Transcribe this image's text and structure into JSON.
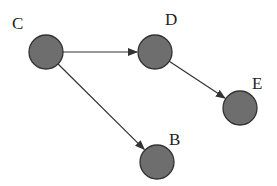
{
  "diagram": {
    "type": "directed-graph",
    "nodes": [
      {
        "id": "C",
        "label": "C",
        "cx": 46,
        "cy": 52,
        "r": 17,
        "lx": 12,
        "ly": 29
      },
      {
        "id": "D",
        "label": "D",
        "cx": 155,
        "cy": 52,
        "r": 17,
        "lx": 165,
        "ly": 25
      },
      {
        "id": "E",
        "label": "E",
        "cx": 240,
        "cy": 108,
        "r": 17,
        "lx": 252,
        "ly": 89
      },
      {
        "id": "B",
        "label": "B",
        "cx": 157,
        "cy": 162,
        "r": 17,
        "lx": 169,
        "ly": 145
      }
    ],
    "edges": [
      {
        "from": "C",
        "to": "D"
      },
      {
        "from": "C",
        "to": "B"
      },
      {
        "from": "D",
        "to": "E"
      }
    ],
    "colors": {
      "node_fill": "#6e6e6e",
      "node_stroke": "#333333",
      "edge": "#333333",
      "background": "#ffffff"
    }
  }
}
